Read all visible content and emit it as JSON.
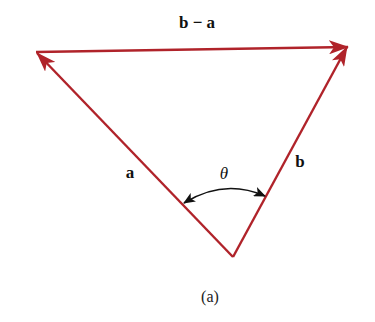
{
  "figure": {
    "caption": "(a)",
    "colors": {
      "vector": "#b0232a",
      "arc": "#111111",
      "text": "#111111"
    },
    "vertices": {
      "origin": [
        233,
        257
      ],
      "tip_a": [
        36,
        52
      ],
      "tip_b": [
        348,
        46
      ]
    },
    "vectors": [
      {
        "name": "a",
        "label": "a",
        "from": "origin",
        "to": "tip_a"
      },
      {
        "name": "b",
        "label": "b",
        "from": "origin",
        "to": "tip_b"
      },
      {
        "name": "b-minus-a",
        "label": "b − a",
        "from": "tip_a",
        "to": "tip_b"
      }
    ],
    "angle": {
      "label": "θ",
      "between": [
        "a",
        "b"
      ],
      "double_headed": true
    }
  }
}
